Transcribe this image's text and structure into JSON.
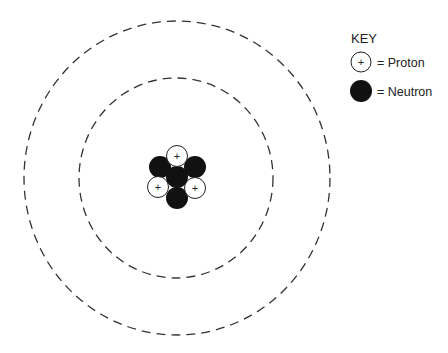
{
  "diagram": {
    "nucleus": {
      "protons": 3,
      "neutrons": 4,
      "proton_symbol": "+"
    },
    "shells": 2
  },
  "key": {
    "title": "KEY",
    "items": [
      {
        "symbol": "+",
        "label": "= Proton",
        "type": "proton"
      },
      {
        "symbol": "",
        "label": "= Neutron",
        "type": "neutron"
      }
    ]
  }
}
